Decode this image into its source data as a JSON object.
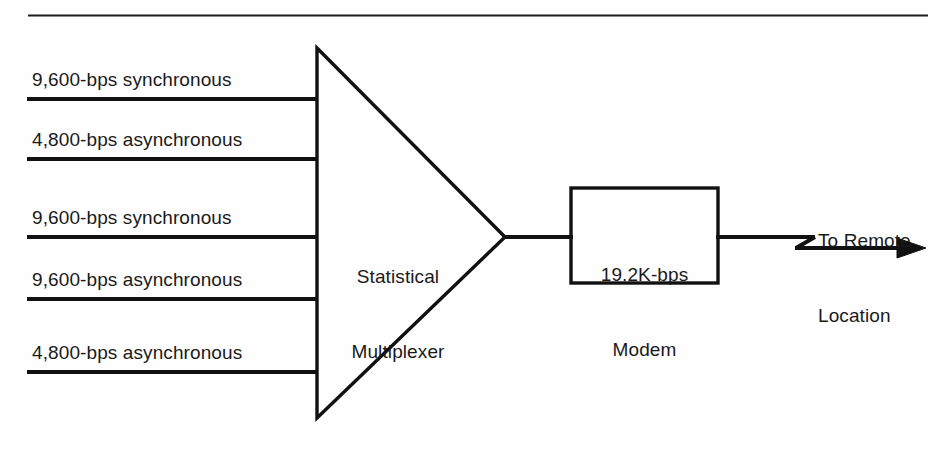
{
  "figure": {
    "background_color": "#fefefe",
    "line_color": "#111111",
    "text_color": "#1a1a1a"
  },
  "top_rule": {
    "name": "horizontal-divider"
  },
  "inputs": [
    {
      "label": "9,600-bps synchronous"
    },
    {
      "label": "4,800-bps asynchronous"
    },
    {
      "label": "9,600-bps synchronous"
    },
    {
      "label": "9,600-bps asynchronous"
    },
    {
      "label": "4,800-bps asynchronous"
    }
  ],
  "multiplexer": {
    "label_line1": "Statistical",
    "label_line2": "Multiplexer"
  },
  "modem": {
    "label_line1": "19.2K-bps",
    "label_line2": "Modem"
  },
  "output": {
    "label_line1": "To Remote",
    "label_line2": "Location"
  }
}
